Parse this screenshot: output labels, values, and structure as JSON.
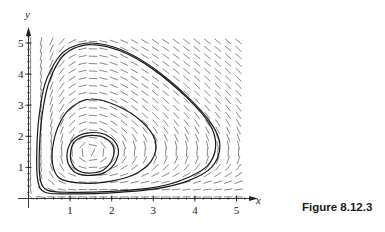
{
  "caption": "Figure 8.12.3",
  "chart_data": {
    "type": "line",
    "subtype": "phase-portrait-with-direction-field",
    "title": "",
    "caption": "Figure 8.12.3",
    "xlabel": "x",
    "ylabel": "y",
    "xlim": [
      0,
      5
    ],
    "ylim": [
      0,
      5
    ],
    "xticks": [
      1,
      2,
      3,
      4,
      5
    ],
    "yticks": [
      1,
      2,
      3,
      4,
      5
    ],
    "grid": false,
    "legend": null,
    "equilibrium": [
      1.5,
      1.5
    ],
    "direction_field": {
      "x_range": [
        0.05,
        5.05
      ],
      "y_range": [
        0.05,
        5.05
      ],
      "nx": 21,
      "ny": 22,
      "model": "x' = x(1.5 - y), y' = 1.19*y(x - 1.5)"
    },
    "series": [
      {
        "name": "outer-orbit",
        "points": [
          [
            1.5,
            5.0
          ],
          [
            2.2,
            4.8
          ],
          [
            3.0,
            4.2
          ],
          [
            3.8,
            3.3
          ],
          [
            4.4,
            2.4
          ],
          [
            4.6,
            1.7
          ],
          [
            4.4,
            1.0
          ],
          [
            3.8,
            0.55
          ],
          [
            3.0,
            0.3
          ],
          [
            2.0,
            0.18
          ],
          [
            1.0,
            0.15
          ],
          [
            0.4,
            0.2
          ],
          [
            0.22,
            0.6
          ],
          [
            0.2,
            1.5
          ],
          [
            0.25,
            2.6
          ],
          [
            0.4,
            3.7
          ],
          [
            0.7,
            4.5
          ],
          [
            1.0,
            4.85
          ],
          [
            1.5,
            5.0
          ]
        ]
      },
      {
        "name": "outer-orbit-2",
        "points": [
          [
            1.5,
            4.95
          ],
          [
            2.2,
            4.75
          ],
          [
            3.0,
            4.15
          ],
          [
            3.8,
            3.25
          ],
          [
            4.35,
            2.4
          ],
          [
            4.5,
            1.7
          ],
          [
            4.3,
            1.05
          ],
          [
            3.7,
            0.6
          ],
          [
            3.0,
            0.35
          ],
          [
            2.0,
            0.23
          ],
          [
            1.0,
            0.2
          ],
          [
            0.45,
            0.27
          ],
          [
            0.28,
            0.65
          ],
          [
            0.26,
            1.5
          ],
          [
            0.32,
            2.6
          ],
          [
            0.47,
            3.65
          ],
          [
            0.75,
            4.45
          ],
          [
            1.05,
            4.8
          ],
          [
            1.5,
            4.95
          ]
        ]
      },
      {
        "name": "middle-orbit",
        "points": [
          [
            1.5,
            3.2
          ],
          [
            2.1,
            3.0
          ],
          [
            2.7,
            2.5
          ],
          [
            3.05,
            1.85
          ],
          [
            2.95,
            1.2
          ],
          [
            2.5,
            0.75
          ],
          [
            1.8,
            0.52
          ],
          [
            1.2,
            0.5
          ],
          [
            0.75,
            0.65
          ],
          [
            0.58,
            1.1
          ],
          [
            0.6,
            1.8
          ],
          [
            0.78,
            2.5
          ],
          [
            1.05,
            2.95
          ],
          [
            1.5,
            3.2
          ]
        ]
      },
      {
        "name": "inner-orbit-1",
        "points": [
          [
            1.5,
            2.12
          ],
          [
            1.9,
            2.02
          ],
          [
            2.15,
            1.65
          ],
          [
            2.1,
            1.2
          ],
          [
            1.85,
            0.85
          ],
          [
            1.5,
            0.74
          ],
          [
            1.15,
            0.82
          ],
          [
            0.95,
            1.15
          ],
          [
            0.95,
            1.6
          ],
          [
            1.12,
            1.95
          ],
          [
            1.5,
            2.12
          ]
        ]
      },
      {
        "name": "inner-orbit-2",
        "points": [
          [
            1.5,
            2.03
          ],
          [
            1.85,
            1.94
          ],
          [
            2.05,
            1.62
          ],
          [
            2.0,
            1.22
          ],
          [
            1.8,
            0.92
          ],
          [
            1.5,
            0.82
          ],
          [
            1.2,
            0.89
          ],
          [
            1.03,
            1.18
          ],
          [
            1.03,
            1.6
          ],
          [
            1.17,
            1.9
          ],
          [
            1.5,
            2.03
          ]
        ]
      }
    ]
  }
}
